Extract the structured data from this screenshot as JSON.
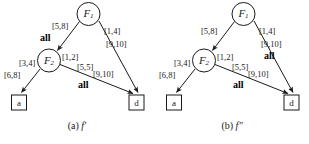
{
  "figure": {
    "background_color": "#ffffff",
    "stroke_color": "#1a1a1a",
    "text_color": "#1a1a1a"
  },
  "panels": [
    {
      "id": "panel-a",
      "caption_prefix": "(a)",
      "caption_function": "f′",
      "nodes": {
        "f1": {
          "label": "F",
          "subscript": "1",
          "shape": "circle"
        },
        "f2": {
          "label": "F",
          "subscript": "2",
          "shape": "circle"
        },
        "a": {
          "label": "a",
          "shape": "square"
        },
        "d": {
          "label": "d",
          "shape": "square"
        }
      },
      "edges": [
        {
          "name": "f1-to-f2",
          "from": "f1",
          "to": "f2",
          "intervals": [
            "[5,8]"
          ],
          "all_marker": "all"
        },
        {
          "name": "f1-to-d",
          "from": "f1",
          "to": "d",
          "intervals": [
            "[1,4]",
            "[9,10]"
          ],
          "all_marker": ""
        },
        {
          "name": "f2-to-a",
          "from": "f2",
          "to": "a",
          "intervals": [
            "[3,4]",
            "[6,8]"
          ],
          "all_marker": ""
        },
        {
          "name": "f2-to-d",
          "from": "f2",
          "to": "d",
          "intervals": [
            "[1,2]",
            "[5,5]",
            "[9,10]"
          ],
          "all_marker": "all"
        }
      ]
    },
    {
      "id": "panel-b",
      "caption_prefix": "(b)",
      "caption_function": "f″",
      "nodes": {
        "f1": {
          "label": "F",
          "subscript": "1",
          "shape": "circle"
        },
        "f2": {
          "label": "F",
          "subscript": "2",
          "shape": "circle"
        },
        "a": {
          "label": "a",
          "shape": "square"
        },
        "d": {
          "label": "d",
          "shape": "square"
        }
      },
      "edges": [
        {
          "name": "f1-to-f2",
          "from": "f1",
          "to": "f2",
          "intervals": [
            "[5,8]"
          ],
          "all_marker": ""
        },
        {
          "name": "f1-to-d",
          "from": "f1",
          "to": "d",
          "intervals": [
            "[1,4]",
            "[9,10]"
          ],
          "all_marker": "all"
        },
        {
          "name": "f2-to-a",
          "from": "f2",
          "to": "a",
          "intervals": [
            "[3,4]",
            "[6,8]"
          ],
          "all_marker": ""
        },
        {
          "name": "f2-to-d",
          "from": "f2",
          "to": "d",
          "intervals": [
            "[1,2]",
            "[5,5]",
            "[9,10]"
          ],
          "all_marker": "all"
        }
      ]
    }
  ]
}
